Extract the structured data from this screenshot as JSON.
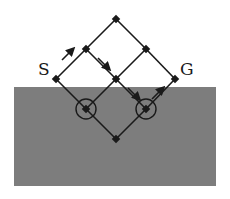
{
  "diagram": {
    "labels": {
      "start": "S",
      "goal": "G"
    },
    "colors": {
      "region": "#7d7d7d",
      "line": "#1a1a1a",
      "background": "#ffffff"
    },
    "region": {
      "x": 14,
      "y": 87,
      "width": 202,
      "height": 99
    },
    "nodes": [
      {
        "id": "top",
        "x": 116,
        "y": 19
      },
      {
        "id": "ul",
        "x": 86,
        "y": 49
      },
      {
        "id": "ur",
        "x": 146,
        "y": 49
      },
      {
        "id": "S",
        "x": 56,
        "y": 79
      },
      {
        "id": "c",
        "x": 116,
        "y": 79
      },
      {
        "id": "G",
        "x": 175,
        "y": 79
      },
      {
        "id": "ll",
        "x": 86,
        "y": 109,
        "circled": true
      },
      {
        "id": "lr",
        "x": 146,
        "y": 109,
        "circled": true
      },
      {
        "id": "bottom",
        "x": 116,
        "y": 139
      }
    ],
    "edges": [
      [
        "S",
        "ul"
      ],
      [
        "ul",
        "top"
      ],
      [
        "top",
        "ur"
      ],
      [
        "ur",
        "G"
      ],
      [
        "ul",
        "c"
      ],
      [
        "c",
        "ur"
      ],
      [
        "S",
        "ll"
      ],
      [
        "ll",
        "c"
      ],
      [
        "c",
        "lr"
      ],
      [
        "lr",
        "G"
      ],
      [
        "ll",
        "bottom"
      ],
      [
        "bottom",
        "lr"
      ]
    ],
    "arrows": [
      {
        "x1": 62,
        "y1": 60,
        "x2": 74,
        "y2": 48
      },
      {
        "x1": 98,
        "y1": 58,
        "x2": 110,
        "y2": 70
      },
      {
        "x1": 128,
        "y1": 88,
        "x2": 140,
        "y2": 100
      },
      {
        "x1": 152,
        "y1": 98,
        "x2": 164,
        "y2": 86
      }
    ]
  }
}
